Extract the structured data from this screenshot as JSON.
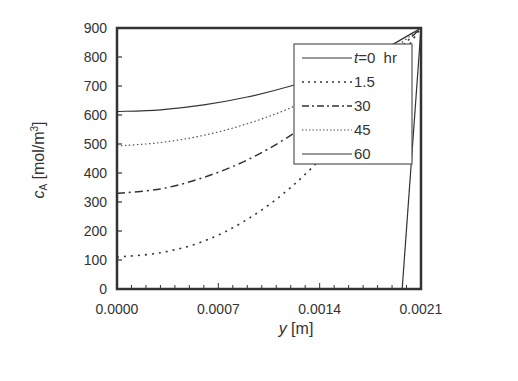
{
  "chart_data": {
    "type": "line",
    "title": "",
    "xlabel": "y [m]",
    "xlabel_var": "y",
    "xlabel_unit": "[m]",
    "ylabel": "cA [mol/m3]",
    "ylabel_var": "c",
    "ylabel_sub": "A",
    "ylabel_unit": "[mol/m",
    "ylabel_sup": "3",
    "ylabel_close": "]",
    "xlim": [
      0,
      0.0021
    ],
    "ylim": [
      0,
      900
    ],
    "xticks": [
      "0.0000",
      "0.0007",
      "0.0014",
      "0.0021"
    ],
    "xtick_values": [
      0,
      0.0007,
      0.0014,
      0.0021
    ],
    "yticks": [
      "0",
      "100",
      "200",
      "300",
      "400",
      "500",
      "600",
      "700",
      "800",
      "900"
    ],
    "ytick_values": [
      0,
      100,
      200,
      300,
      400,
      500,
      600,
      700,
      800,
      900
    ],
    "grid": false,
    "legend_position": "upper right (inside)",
    "legend": {
      "title_prefix": "t",
      "unit": "hr",
      "entries": [
        "t=0",
        "1.5",
        "30",
        "45",
        "60"
      ]
    },
    "series": [
      {
        "name": "t=0 hr",
        "style": "solid",
        "x": [
          0,
          0.0003,
          0.0006,
          0.0009,
          0.0012,
          0.0015,
          0.0018,
          0.0021
        ],
        "y": [
          612,
          618,
          635,
          662,
          700,
          750,
          815,
          900
        ]
      },
      {
        "name": "1.5",
        "style": "dotted",
        "x": [
          0,
          0.0003,
          0.0006,
          0.0009,
          0.0012,
          0.0015,
          0.0018,
          0.0021
        ],
        "y": [
          110,
          125,
          165,
          240,
          350,
          500,
          690,
          900
        ]
      },
      {
        "name": "30",
        "style": "dash-dot",
        "x": [
          0,
          0.0003,
          0.0006,
          0.0009,
          0.0012,
          0.0015,
          0.0018,
          0.0021
        ],
        "y": [
          330,
          345,
          385,
          445,
          530,
          640,
          760,
          900
        ]
      },
      {
        "name": "45",
        "style": "fine-dotted",
        "x": [
          0,
          0.0003,
          0.0006,
          0.0009,
          0.0012,
          0.0015,
          0.0018,
          0.0021
        ],
        "y": [
          493,
          505,
          530,
          570,
          625,
          700,
          790,
          900
        ]
      },
      {
        "name": "60",
        "style": "solid",
        "x": [
          0.00197,
          0.0021
        ],
        "y": [
          0,
          900
        ]
      }
    ]
  },
  "legend": {
    "entry0_var": "t",
    "entry0_rest": "=0  hr",
    "entry1": "1.5",
    "entry2": "30",
    "entry3": "45",
    "entry4": "60"
  }
}
